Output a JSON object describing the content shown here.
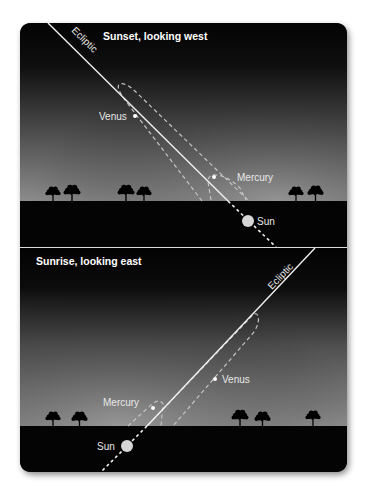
{
  "top_panel": {
    "title": "Sunset, looking west",
    "ecliptic_label": "Ecliptic",
    "labels": {
      "venus": "Venus",
      "mercury": "Mercury",
      "sun": "Sun"
    }
  },
  "bottom_panel": {
    "title": "Sunrise, looking east",
    "ecliptic_label": "Ecliptic",
    "labels": {
      "venus": "Venus",
      "mercury": "Mercury",
      "sun": "Sun"
    }
  },
  "colors": {
    "sky_top": "#050505",
    "sky_horizon": "#8a8a8a",
    "ground": "#050505",
    "line": "#f2f2f2",
    "dashed": "#c8c8c8",
    "sun": "#d9d9d9"
  }
}
